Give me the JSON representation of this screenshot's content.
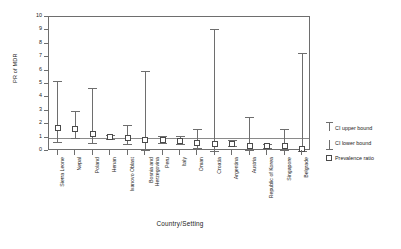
{
  "chart_data": {
    "type": "scatter",
    "title": "",
    "xlabel": "Country/Setting",
    "ylabel": "PR of MDR",
    "ylim": [
      0,
      10
    ],
    "yticks": [
      0,
      1,
      2,
      3,
      4,
      5,
      6,
      7,
      8,
      9,
      10
    ],
    "ytick_labels": [
      "0",
      "1",
      "2",
      "3",
      "4",
      "5",
      "6",
      "7",
      "8",
      "9",
      "10"
    ],
    "grid": false,
    "reference_line": 1,
    "legend_position": "right",
    "categories": [
      "Sierra Leone",
      "Nepal",
      "Poland",
      "Henan",
      "Ivanovo Oblast",
      "Bosnia and Herzegovina",
      "Peru",
      "Italy",
      "Oman",
      "Croatia",
      "Argentina",
      "Austria",
      "Republic of Korea",
      "Singapore",
      "Belgrade"
    ],
    "series": [
      {
        "name": "Prevalence ratio",
        "values": [
          1.75,
          1.65,
          1.3,
          1.05,
          0.95,
          0.8,
          0.85,
          0.75,
          0.6,
          0.5,
          0.55,
          0.4,
          0.35,
          0.4,
          0.15
        ]
      },
      {
        "name": "CI lower bound",
        "values": [
          0.65,
          1.0,
          0.6,
          0.9,
          0.5,
          0.08,
          0.6,
          0.5,
          0.2,
          0.03,
          0.35,
          0.07,
          0.2,
          0.1,
          0.02
        ]
      },
      {
        "name": "CI upper bound",
        "values": [
          5.2,
          3.0,
          4.7,
          1.2,
          1.95,
          6.0,
          1.1,
          1.1,
          1.65,
          9.1,
          0.8,
          2.55,
          0.55,
          1.65,
          7.3
        ]
      }
    ]
  },
  "legend": {
    "entries": [
      {
        "label": "CI upper bound",
        "symbol": "cap-top"
      },
      {
        "label": "CI lower bound",
        "symbol": "cap-bottom"
      },
      {
        "label": "Prevalence ratio",
        "symbol": "square"
      }
    ]
  },
  "colors": {
    "axis": "#6e6e6e",
    "marker_stroke": "#4a4a4a",
    "marker_fill": "#ffffff",
    "reference_line": "#8a8a8a",
    "text": "#1a1a1a",
    "background": "#ffffff"
  }
}
